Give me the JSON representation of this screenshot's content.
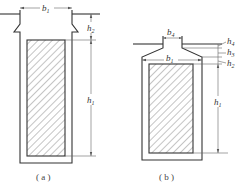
{
  "figure": {
    "panels": [
      {
        "id": "a",
        "caption": "( a )",
        "labels": {
          "b1": {
            "main": "b",
            "sub": "1"
          },
          "h2": {
            "main": "h",
            "sub": "2"
          },
          "h1": {
            "main": "h",
            "sub": "1"
          }
        }
      },
      {
        "id": "b",
        "caption": "( b )",
        "labels": {
          "b4": {
            "main": "b",
            "sub": "4"
          },
          "b1": {
            "main": "b",
            "sub": "1"
          },
          "h4": {
            "main": "h",
            "sub": "4"
          },
          "h3": {
            "main": "h",
            "sub": "3"
          },
          "h2": {
            "main": "h",
            "sub": "2"
          },
          "h1": {
            "main": "h",
            "sub": "1"
          }
        }
      }
    ],
    "colors": {
      "line": "#333333",
      "hatch": "#555555",
      "background": "#ffffff"
    }
  }
}
